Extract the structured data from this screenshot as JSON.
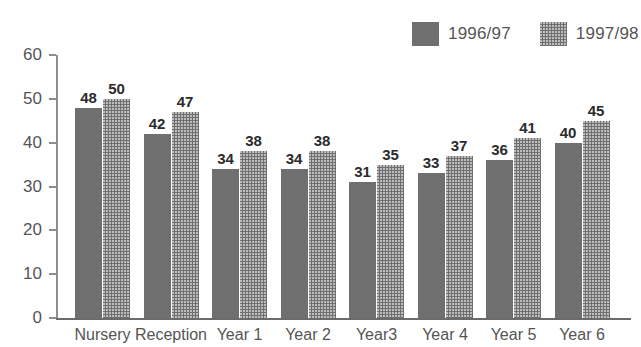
{
  "chart_data": {
    "type": "bar",
    "title": "",
    "subtitle": "",
    "xlabel": "",
    "ylabel": "",
    "ylim": [
      0,
      60
    ],
    "yticks": [
      0,
      10,
      20,
      30,
      40,
      50,
      60
    ],
    "grid": false,
    "legend_position": "top-right",
    "categories": [
      "Nursery",
      "Reception",
      "Year 1",
      "Year 2",
      "Year3",
      "Year 4",
      "Year 5",
      "Year 6"
    ],
    "series": [
      {
        "name": "1996/97",
        "color": "#6f6f6f",
        "fill": "solid",
        "values": [
          48,
          42,
          34,
          34,
          31,
          33,
          36,
          40
        ]
      },
      {
        "name": "1997/98",
        "color": "#6f6f6f",
        "fill": "dotted-texture",
        "values": [
          50,
          47,
          38,
          38,
          35,
          37,
          41,
          45
        ]
      }
    ],
    "annotations": []
  },
  "legend": {
    "entries": [
      {
        "label": "1996/97",
        "swatch": "legend-swatch-1996-97"
      },
      {
        "label": "1997/98",
        "swatch": "legend-swatch-1997-98"
      }
    ]
  },
  "axis": {
    "y_tick_labels": [
      "60",
      "50",
      "40",
      "30",
      "20",
      "10",
      "0"
    ],
    "x_tick_labels": [
      "Nursery",
      "Reception",
      "Year 1",
      "Year 2",
      "Year3",
      "Year 4",
      "Year 5",
      "Year 6"
    ]
  },
  "bar_values": {
    "series_1996_97": [
      "48",
      "42",
      "34",
      "34",
      "31",
      "33",
      "36",
      "40"
    ],
    "series_1997_98": [
      "50",
      "47",
      "38",
      "38",
      "35",
      "37",
      "41",
      "45"
    ]
  },
  "colors": {
    "bar": "#6f6f6f",
    "axis": "#8d8d8d",
    "text": "#555555",
    "value_text": "#2b2b2b",
    "background": "#ffffff"
  }
}
